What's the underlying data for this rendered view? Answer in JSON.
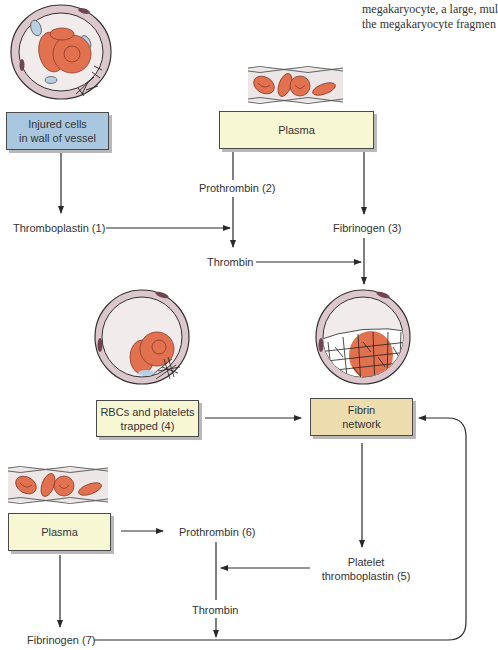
{
  "caption": {
    "line1": "megakaryocyte, a large, mul",
    "line2": "the megakaryocyte fragmen"
  },
  "boxes": {
    "injured_cells": "Injured cells in wall of vessel",
    "injured_cells_l1": "Injured cells",
    "injured_cells_l2": "in wall of vessel",
    "plasma_top": "Plasma",
    "rbcs_trapped_l1": "RBCs and platelets",
    "rbcs_trapped_l2": "trapped (4)",
    "fibrin_network_l1": "Fibrin",
    "fibrin_network_l2": "network",
    "plasma_bottom": "Plasma"
  },
  "labels": {
    "thromboplastin_1": "Thromboplastin (1)",
    "prothrombin_2": "Prothrombin (2)",
    "fibrinogen_3": "Fibrinogen (3)",
    "thrombin_top": "Thrombin",
    "prothrombin_6": "Prothrombin (6)",
    "platelet_thromboplastin_l1": "Platelet",
    "platelet_thromboplastin_l2": "thromboplastin (5)",
    "thrombin_bottom": "Thrombin",
    "fibrinogen_7": "Fibrinogen (7)"
  },
  "colors": {
    "injured_box": "#a9c8e0",
    "plasma_box": "#f8f7d4",
    "fibrin_box": "#ecdcae",
    "rbc": "#e2714f",
    "vessel_wall": "#dcc8cc",
    "lumen": "#f1ebec"
  }
}
